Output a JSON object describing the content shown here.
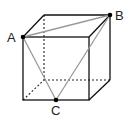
{
  "figure": {
    "type": "cube-with-triangle",
    "labels": {
      "A": "A",
      "B": "B",
      "C": "C"
    },
    "points": {
      "A": {
        "x": 23,
        "y": 37,
        "description": "front top-left vertex"
      },
      "B": {
        "x": 110,
        "y": 15,
        "description": "back top-right vertex"
      },
      "C": {
        "x": 56,
        "y": 100,
        "description": "midpoint of front bottom edge"
      }
    },
    "colors": {
      "edges": "#111111",
      "hidden_edges": "#222222",
      "triangle": "#9a9a9a",
      "points": "#000000"
    }
  }
}
